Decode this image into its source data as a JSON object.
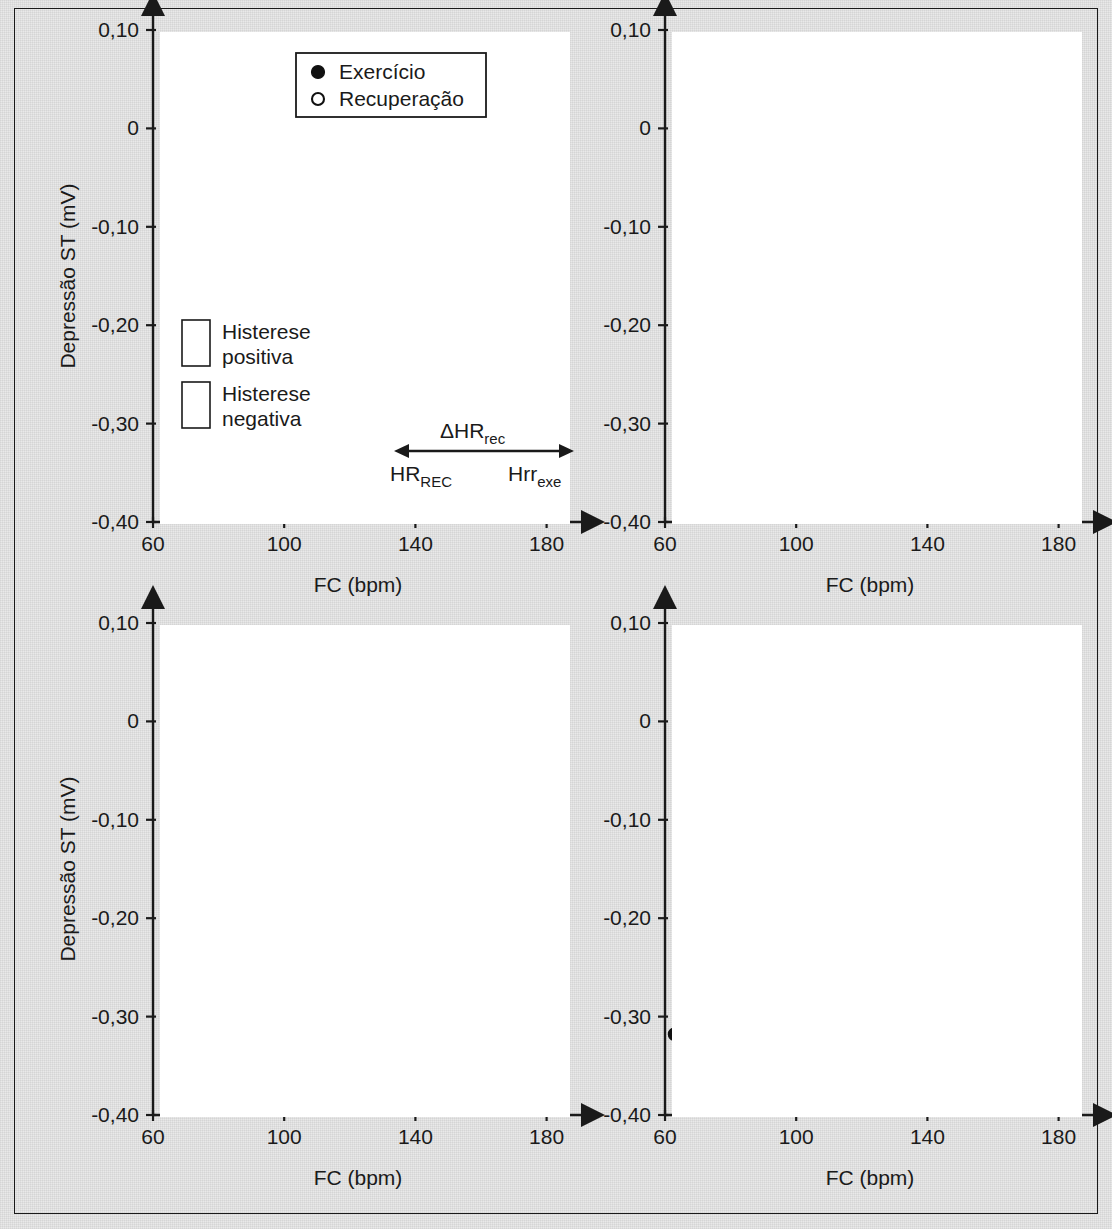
{
  "figure": {
    "y_axis_title": "Depressão ST (mV)",
    "x_axis_title": "FC (bpm)",
    "y_ticks": [
      "0,10",
      "0",
      "-0,10",
      "-0,20",
      "-0,30",
      "-0,40"
    ],
    "y_tick_values": [
      0.1,
      0,
      -0.1,
      -0.2,
      -0.3,
      -0.4
    ],
    "x_ticks": [
      "60",
      "100",
      "140",
      "180"
    ],
    "x_tick_values": [
      60,
      100,
      140,
      180
    ],
    "ylim": [
      -0.4,
      0.1
    ],
    "xlim": [
      60,
      185
    ],
    "colors": {
      "ink": "#1a1a1a",
      "plot_background": "#ffffff",
      "page_background": "#e9e9e9"
    }
  },
  "legend": {
    "entries": [
      {
        "marker": "filled-circle",
        "label": "Exercício"
      },
      {
        "marker": "open-circle",
        "label": "Recuperação"
      }
    ]
  },
  "hatch_legend": {
    "entries": [
      {
        "pattern": "crosshatch",
        "line1": "Histerese",
        "line2": "positiva"
      },
      {
        "pattern": "diagonal",
        "line1": "Histerese",
        "line2": "negativa"
      }
    ]
  },
  "hr_annotation": {
    "delta_label": "ΔHR",
    "delta_sub": "rec",
    "left_label": "HR",
    "left_sub": "REC",
    "right_label": "Hrr",
    "right_sub": "exe"
  },
  "chart_data": [
    {
      "id": "panel-a",
      "type": "line",
      "position": "top-left",
      "title": "",
      "xlabel": "FC (bpm)",
      "ylabel": "Depressão ST (mV)",
      "xlim": [
        60,
        185
      ],
      "ylim": [
        -0.4,
        0.1
      ],
      "grid": false,
      "annotation": "Histerese ST/HR = -0,13 mV",
      "caption_line1": "Clinicamente normal",
      "caption_line2": "Masculino, 52 anos",
      "hysteresis_mv": -0.13,
      "hysteresis_type": "negative",
      "series": [
        {
          "name": "Exercício",
          "marker": "filled-circle",
          "x": [
            96,
            105,
            106,
            107,
            112,
            121,
            126,
            128,
            130,
            141,
            149,
            152,
            155,
            158,
            161,
            164,
            176
          ],
          "y": [
            -0.029,
            -0.043,
            -0.047,
            -0.058,
            -0.047,
            -0.068,
            -0.079,
            -0.082,
            -0.09,
            -0.056,
            -0.074,
            -0.086,
            -0.104,
            -0.079,
            -0.071,
            -0.077,
            -0.058
          ]
        },
        {
          "name": "Recuperação",
          "marker": "open-circle",
          "x": [
            140,
            146,
            166
          ],
          "y": [
            -0.104,
            -0.262,
            -0.26
          ]
        }
      ],
      "hatch_regions": [
        {
          "pattern": "diagonal",
          "label": "Histerese negativa"
        }
      ]
    },
    {
      "id": "panel-b",
      "type": "line",
      "position": "top-right",
      "title": "",
      "xlabel": "FC (bpm)",
      "ylabel": "Depressão ST (mV)",
      "xlim": [
        60,
        185
      ],
      "ylim": [
        -0.4,
        0.1
      ],
      "grid": false,
      "annotation": "Histerese ST/HR = 0,04 mV",
      "caption_line1": "3V-CAD",
      "caption_line2": "Masculino, 57 anos",
      "hysteresis_mv": 0.04,
      "hysteresis_type": "positive",
      "series": [
        {
          "name": "Exercício",
          "marker": "filled-circle",
          "x": [
            67,
            83,
            88,
            89,
            90,
            92,
            99,
            105,
            111,
            113,
            118,
            122,
            126,
            140
          ],
          "y": [
            -0.04,
            -0.049,
            -0.044,
            -0.047,
            -0.05,
            -0.044,
            -0.026,
            -0.025,
            -0.004,
            0.01,
            0.018,
            0.026,
            0.033,
            0.059
          ]
        },
        {
          "name": "Recuperação",
          "marker": "open-circle",
          "x": [
            83,
            92,
            113,
            126,
            133,
            140
          ],
          "y": [
            0.03,
            0.04,
            0.039,
            0.043,
            0.048,
            0.059
          ]
        }
      ],
      "hatch_regions": [
        {
          "pattern": "crosshatch",
          "label": "Histerese positiva"
        }
      ]
    },
    {
      "id": "panel-c",
      "type": "line",
      "position": "bottom-left",
      "title": "",
      "xlabel": "FC (bpm)",
      "ylabel": "Depressão ST (mV)",
      "xlim": [
        60,
        185
      ],
      "ylim": [
        -0.4,
        0.1
      ],
      "grid": false,
      "annotation": "Histerese ST/HR = -0,03 mV",
      "caption_line1": "Normal pelo MIBI SPECT",
      "caption_line2": "Feminino, 51 anos",
      "hysteresis_mv": -0.03,
      "hysteresis_type": "mixed",
      "series": [
        {
          "name": "Exercício",
          "marker": "filled-circle",
          "x": [
            71,
            98,
            101,
            102,
            103,
            104,
            132,
            136,
            137,
            150,
            157,
            164
          ],
          "y": [
            -0.207,
            -0.2,
            -0.19,
            -0.176,
            -0.183,
            -0.156,
            -0.113,
            -0.112,
            -0.073,
            -0.055,
            -0.028,
            0.015
          ]
        },
        {
          "name": "Recuperação",
          "marker": "open-circle",
          "x": [
            98,
            117,
            140,
            164
          ],
          "y": [
            -0.166,
            -0.128,
            -0.174,
            0.015
          ]
        }
      ],
      "hatch_regions": [
        {
          "pattern": "crosshatch",
          "label": "Histerese positiva"
        },
        {
          "pattern": "diagonal",
          "label": "Histerese negativa"
        }
      ]
    },
    {
      "id": "panel-d",
      "type": "line",
      "position": "bottom-right",
      "title": "",
      "xlabel": "FC (bpm)",
      "ylabel": "Depressão ST (mV)",
      "xlim": [
        60,
        185
      ],
      "ylim": [
        -0.4,
        0.1
      ],
      "grid": false,
      "annotation": "Histerese ST/HR = 0,02 mV",
      "caption_line1": "1v-CAD",
      "caption_line2": "Masculino, 57 anos",
      "hysteresis_mv": 0.02,
      "hysteresis_type": "positive",
      "series": [
        {
          "name": "Exercício",
          "marker": "filled-circle",
          "x": [
            63,
            78,
            79,
            84,
            86,
            96,
            97,
            100,
            105,
            110,
            120,
            127,
            134,
            139,
            143,
            148
          ],
          "y": [
            -0.318,
            -0.308,
            -0.311,
            -0.296,
            -0.291,
            -0.272,
            -0.266,
            -0.258,
            -0.245,
            -0.237,
            -0.217,
            -0.188,
            -0.155,
            -0.131,
            -0.117,
            -0.034
          ]
        },
        {
          "name": "Recuperação",
          "marker": "open-circle",
          "x": [
            97,
            97,
            122,
            148
          ],
          "y": [
            -0.176,
            -0.199,
            -0.217,
            -0.034
          ]
        }
      ],
      "hatch_regions": [
        {
          "pattern": "crosshatch",
          "label": "Histerese positiva"
        }
      ]
    }
  ]
}
